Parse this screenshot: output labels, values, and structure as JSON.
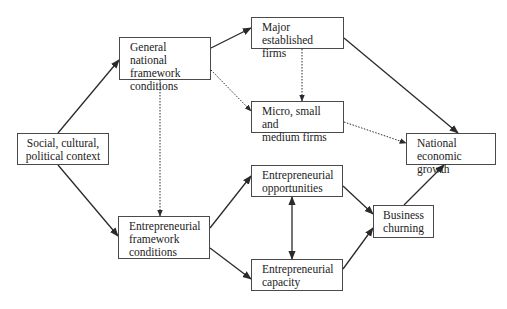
{
  "diagram": {
    "nodes": [
      {
        "id": "social",
        "label": "Social, cultural,\npolitical context",
        "x": 17,
        "y": 133,
        "w": 92,
        "h": 32,
        "align": "center"
      },
      {
        "id": "general",
        "label": "General national\nframework\nconditions",
        "x": 119,
        "y": 37,
        "w": 92,
        "h": 43,
        "align": "left"
      },
      {
        "id": "major",
        "label": "Major established\nfirms",
        "x": 251,
        "y": 17,
        "w": 93,
        "h": 32,
        "align": "left"
      },
      {
        "id": "micro",
        "label": "Micro, small and\nmedium firms",
        "x": 251,
        "y": 101,
        "w": 93,
        "h": 32,
        "align": "left"
      },
      {
        "id": "national",
        "label": "National economic\ngrowth",
        "x": 406,
        "y": 133,
        "w": 90,
        "h": 32,
        "align": "left"
      },
      {
        "id": "entr_framework",
        "label": "Entrepreneurial\nframework\nconditions",
        "x": 118,
        "y": 216,
        "w": 92,
        "h": 43,
        "align": "left"
      },
      {
        "id": "opportunities",
        "label": "Entrepreneurial\nopportunities",
        "x": 251,
        "y": 165,
        "w": 92,
        "h": 32,
        "align": "left"
      },
      {
        "id": "capacity",
        "label": "Entrepreneurial\ncapacity",
        "x": 251,
        "y": 259,
        "w": 92,
        "h": 32,
        "align": "left"
      },
      {
        "id": "churning",
        "label": "Business\nchurning",
        "x": 373,
        "y": 205,
        "w": 61,
        "h": 33,
        "align": "center"
      }
    ],
    "edges": [
      {
        "from": "social",
        "to": "general",
        "style": "solid",
        "x1": 58,
        "y1": 133,
        "x2": 119,
        "y2": 60
      },
      {
        "from": "social",
        "to": "entr_framework",
        "style": "solid",
        "x1": 58,
        "y1": 165,
        "x2": 118,
        "y2": 236
      },
      {
        "from": "general",
        "to": "major",
        "style": "solid",
        "x1": 211,
        "y1": 48,
        "x2": 251,
        "y2": 28
      },
      {
        "from": "general",
        "to": "micro",
        "style": "dotted",
        "x1": 211,
        "y1": 70,
        "x2": 251,
        "y2": 111
      },
      {
        "from": "general",
        "to": "entr_framework",
        "style": "dotted",
        "x1": 160,
        "y1": 80,
        "x2": 160,
        "y2": 216
      },
      {
        "from": "major",
        "to": "micro",
        "style": "dotted",
        "x1": 302,
        "y1": 49,
        "x2": 302,
        "y2": 101
      },
      {
        "from": "major",
        "to": "national",
        "style": "solid",
        "x1": 344,
        "y1": 38,
        "x2": 458,
        "y2": 133
      },
      {
        "from": "micro",
        "to": "national",
        "style": "dotted",
        "x1": 344,
        "y1": 122,
        "x2": 406,
        "y2": 143
      },
      {
        "from": "entr_framework",
        "to": "opportunities",
        "style": "solid",
        "x1": 210,
        "y1": 228,
        "x2": 251,
        "y2": 176
      },
      {
        "from": "entr_framework",
        "to": "capacity",
        "style": "solid",
        "x1": 210,
        "y1": 248,
        "x2": 251,
        "y2": 279
      },
      {
        "from": "opportunities",
        "to": "capacity",
        "style": "solid-double",
        "x1": 292,
        "y1": 197,
        "x2": 292,
        "y2": 259
      },
      {
        "from": "opportunities",
        "to": "churning",
        "style": "solid",
        "x1": 343,
        "y1": 186,
        "x2": 373,
        "y2": 214
      },
      {
        "from": "capacity",
        "to": "churning",
        "style": "solid",
        "x1": 343,
        "y1": 269,
        "x2": 373,
        "y2": 228
      },
      {
        "from": "churning",
        "to": "national",
        "style": "solid",
        "x1": 404,
        "y1": 205,
        "x2": 444,
        "y2": 165
      }
    ],
    "colors": {
      "line": "#2a2a2a",
      "border": "#4a4a4a",
      "text": "#222222"
    }
  }
}
